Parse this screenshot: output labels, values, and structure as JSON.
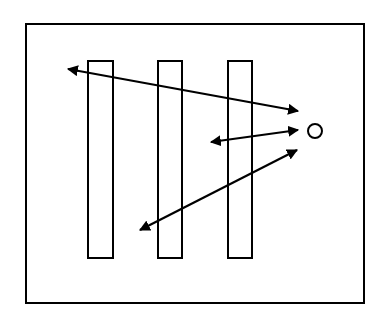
{
  "canvas": {
    "width": 384,
    "height": 318,
    "background": "#ffffff",
    "stroke": "#000000"
  },
  "frame": {
    "x": 26,
    "y": 24,
    "width": 338,
    "height": 279,
    "stroke_width": 2
  },
  "bars": [
    {
      "id": "bar-1",
      "x": 88,
      "y": 61,
      "width": 25,
      "height": 197
    },
    {
      "id": "bar-2",
      "x": 158,
      "y": 61,
      "width": 24,
      "height": 197
    },
    {
      "id": "bar-3",
      "x": 228,
      "y": 61,
      "width": 24,
      "height": 197
    }
  ],
  "source_circle": {
    "cx": 315,
    "cy": 131,
    "r": 7
  },
  "arrows": [
    {
      "id": "arrow-top",
      "x1": 68,
      "y1": 69,
      "x2": 298,
      "y2": 111,
      "bidirectional": true
    },
    {
      "id": "arrow-middle",
      "x1": 211,
      "y1": 142,
      "x2": 298,
      "y2": 130,
      "bidirectional": true
    },
    {
      "id": "arrow-bottom",
      "x1": 140,
      "y1": 230,
      "x2": 297,
      "y2": 150,
      "bidirectional": true
    }
  ]
}
